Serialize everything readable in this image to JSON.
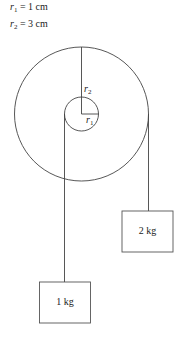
{
  "given": {
    "r1": {
      "symbol": "r",
      "sub": "1",
      "value": " = 1 cm"
    },
    "r2": {
      "symbol": "r",
      "sub": "2",
      "value": " = 3 cm"
    }
  },
  "pulley": {
    "outer_label": {
      "symbol": "r",
      "sub": "2"
    },
    "inner_label": {
      "symbol": "r",
      "sub": "1"
    }
  },
  "masses": [
    {
      "label": "1 kg",
      "side": "left, hanging from inner radius r1"
    },
    {
      "label": "2 kg",
      "side": "right, hanging from outer radius r2"
    }
  ],
  "colors": {
    "line": "#444444",
    "background": "#ffffff"
  }
}
